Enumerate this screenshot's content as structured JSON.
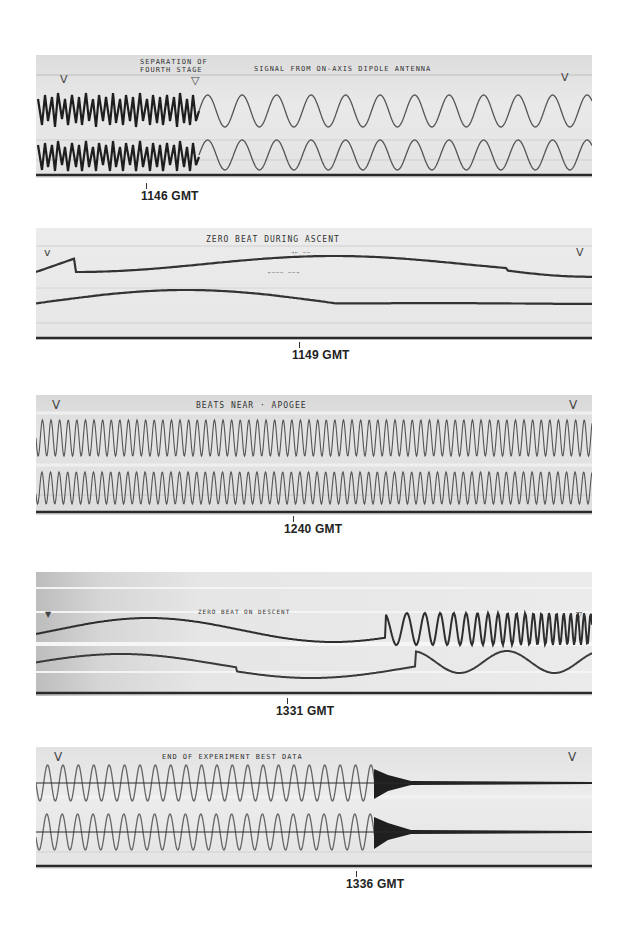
{
  "figure": {
    "panels": [
      {
        "id": "p1",
        "time_label": "1146 GMT",
        "annotations": [
          "SEPARATION OF",
          "FOURTH STAGE",
          "SIGNAL FROM ON-AXIS DIPOLE ANTENNA"
        ],
        "description": "Noisy signal until fourth stage separation, then clean sinusoids (2 traces)"
      },
      {
        "id": "p2",
        "time_label": "1149 GMT",
        "annotations": [
          "ZERO BEAT DURING ASCENT"
        ],
        "description": "Two slow beat envelopes"
      },
      {
        "id": "p3",
        "time_label": "1240 GMT",
        "annotations": [
          "BEATS NEAR APOGEE"
        ],
        "description": "Two dense high-frequency traces"
      },
      {
        "id": "p4",
        "time_label": "1331 GMT",
        "annotations": [
          "ZERO BEAT ON DESCENT"
        ],
        "description": "Two slow beat traces increasing in frequency at right"
      },
      {
        "id": "p5",
        "time_label": "1336 GMT",
        "annotations": [
          "END OF EXPERIMENT BEST DATA"
        ],
        "description": "Sinusoids ending in a burst, then flat lines"
      }
    ],
    "markers": {
      "timing_mark": "V",
      "event_mark": "▽"
    },
    "colors": {
      "trace": "#3a3a3a",
      "paper": "#e4e4e4",
      "rule": "#2a2a2a",
      "background": "#ffffff"
    }
  }
}
